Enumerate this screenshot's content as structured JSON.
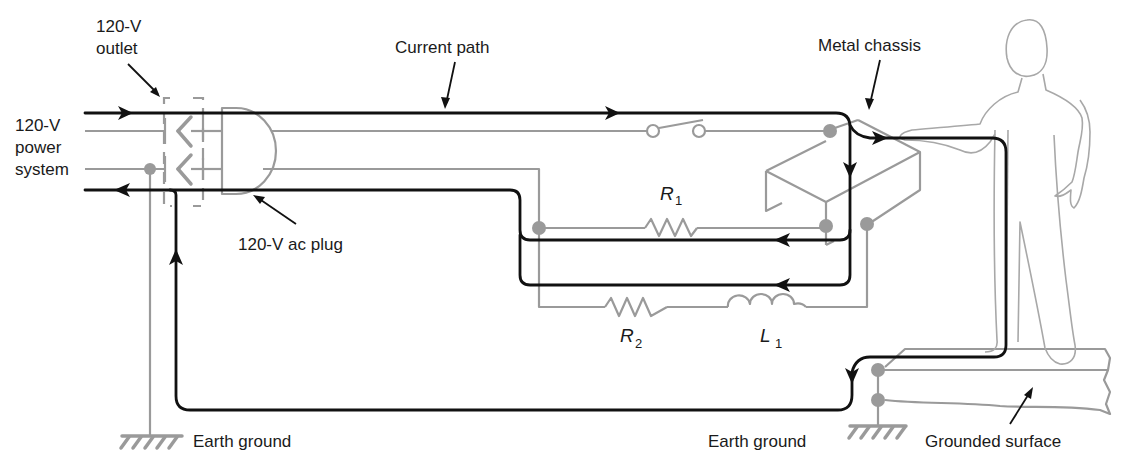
{
  "labels": {
    "outlet_line1": "120-V",
    "outlet_line2": "outlet",
    "power_line1": "120-V",
    "power_line2": "power",
    "power_line3": "system",
    "plug": "120-V ac plug",
    "current_path": "Current path",
    "metal_chassis": "Metal chassis",
    "r1_main": "R",
    "r1_sub": "1",
    "r2_main": "R",
    "r2_sub": "2",
    "l1_main": "L",
    "l1_sub": "1",
    "earth_ground_left": "Earth ground",
    "earth_ground_right": "Earth ground",
    "grounded_surface": "Grounded surface"
  },
  "components": [
    {
      "id": "switch",
      "type": "switch",
      "state": "open"
    },
    {
      "id": "R1",
      "type": "resistor"
    },
    {
      "id": "R2",
      "type": "resistor"
    },
    {
      "id": "L1",
      "type": "inductor"
    },
    {
      "id": "outlet",
      "type": "120-V outlet"
    },
    {
      "id": "plug",
      "type": "120-V ac plug"
    },
    {
      "id": "chassis",
      "type": "metal chassis"
    },
    {
      "id": "person",
      "type": "human figure touching chassis"
    },
    {
      "id": "ground_left",
      "type": "earth ground"
    },
    {
      "id": "ground_right",
      "type": "earth ground"
    },
    {
      "id": "surface",
      "type": "grounded surface"
    }
  ],
  "colors": {
    "wire": "#9a9a9a",
    "current_path": "#111111",
    "background": "#ffffff"
  }
}
